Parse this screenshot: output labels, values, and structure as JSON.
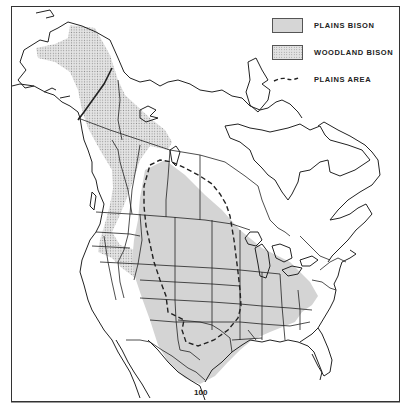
{
  "figure": {
    "type": "historical range map"
  },
  "legend": {
    "items": [
      {
        "key": "plains_bison",
        "label": "PLAINS BISON",
        "fill": "#d6d6d6",
        "style": "solid gray"
      },
      {
        "key": "woodland_bison",
        "label": "WOODLAND BISON",
        "fill": "#e2e2e2",
        "style": "dotted stipple"
      },
      {
        "key": "plains_area",
        "label": "PLAINS AREA",
        "style": "dashed line",
        "color": "#222222"
      }
    ]
  },
  "annotations": {
    "meridian_label": "100"
  },
  "colors": {
    "outline": "#222222",
    "frame": "#333333",
    "background": "#ffffff",
    "plains_fill": "#d6d6d6",
    "woodland_fill": "#e2e2e2"
  }
}
